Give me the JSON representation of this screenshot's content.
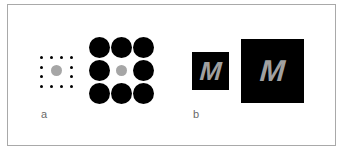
{
  "figure": {
    "panels": [
      {
        "id": "a",
        "label": "a",
        "description": "Ebbinghaus/contrast illusion: identical gray center circles surrounded by small dots vs large black circles",
        "small_context": {
          "shape": "dots",
          "grid": "4x4 perimeter",
          "dot_count": 12,
          "dot_color": "#000000"
        },
        "large_context": {
          "shape": "circles",
          "grid": "3x3",
          "circle_count": 8,
          "circle_color": "#000000"
        },
        "target_color": "#a6a6a6"
      },
      {
        "id": "b",
        "label": "b",
        "description": "Identical gray letter M on small and large black squares",
        "small_square": {
          "letter": "M",
          "bg_color": "#000000"
        },
        "large_square": {
          "letter": "M",
          "bg_color": "#000000"
        },
        "letter_color": "#a0a0a0"
      }
    ],
    "frame_border_color": "#a9a9a9"
  }
}
